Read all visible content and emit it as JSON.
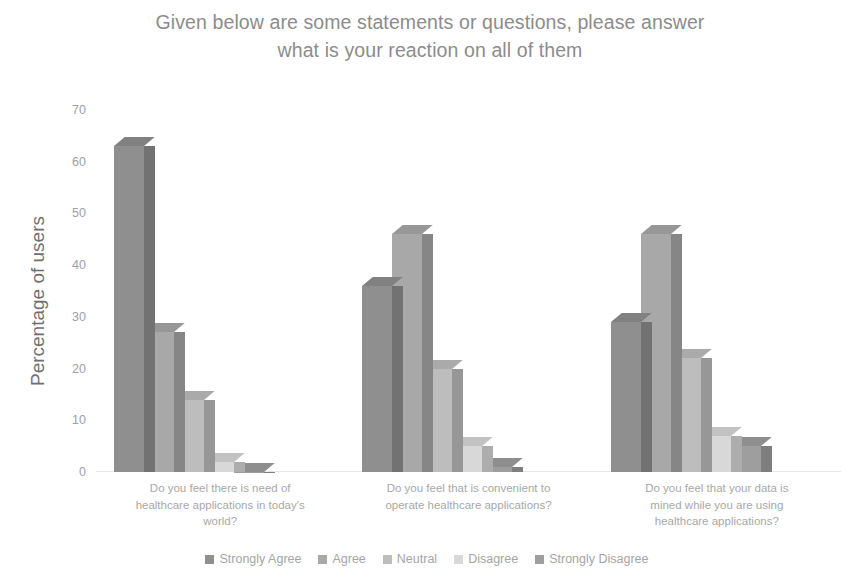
{
  "chart": {
    "title": "Given below are some statements or questions, please answer\nwhat is your reaction on all of them",
    "y_axis_title": "Percentage of users"
  },
  "legend": {
    "items": [
      {
        "label": "Strongly Agree",
        "color": "#8f8f8f"
      },
      {
        "label": "Agree",
        "color": "#a8a8a8"
      },
      {
        "label": "Neutral",
        "color": "#bdbdbd"
      },
      {
        "label": "Disagree",
        "color": "#d8d8d8"
      },
      {
        "label": "Strongly Disagree",
        "color": "#9e9e9e"
      }
    ]
  },
  "categories_display": [
    "Do you feel there is need of\nhealthcare applications in today's\nworld?",
    "Do you feel that is convenient to\noperate healthcare applications?",
    "Do you feel that your data is\nmined while you are using\nhealthcare applications?"
  ],
  "y_ticks": [
    "0",
    "10",
    "20",
    "30",
    "40",
    "50",
    "60",
    "70"
  ],
  "chart_data": {
    "type": "bar",
    "title": "Given below are some statements or questions, please answer what is your reaction on all of them",
    "xlabel": "",
    "ylabel": "Percentage of users",
    "ylim": [
      0,
      70
    ],
    "ytick_step": 10,
    "grid": false,
    "legend_position": "bottom",
    "style": "3d-clustered-column-grayscale",
    "categories": [
      "Do you feel there is need of healthcare applications in today's world?",
      "Do you feel that is convenient to operate healthcare applications?",
      "Do you feel that your data is mined while you are using healthcare applications?"
    ],
    "series": [
      {
        "name": "Strongly Agree",
        "color": "#8f8f8f",
        "values": [
          63,
          36,
          29
        ]
      },
      {
        "name": "Agree",
        "color": "#a8a8a8",
        "values": [
          27,
          46,
          46
        ]
      },
      {
        "name": "Neutral",
        "color": "#bdbdbd",
        "values": [
          14,
          20,
          22
        ]
      },
      {
        "name": "Disagree",
        "color": "#d8d8d8",
        "values": [
          2,
          5,
          7
        ]
      },
      {
        "name": "Strongly Disagree",
        "color": "#9e9e9e",
        "values": [
          0,
          1,
          5
        ]
      }
    ]
  }
}
